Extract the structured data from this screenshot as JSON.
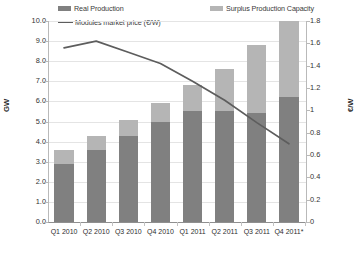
{
  "chart_data": {
    "type": "bar",
    "title": "",
    "subtitle": "",
    "categories": [
      "Q1 2010",
      "Q2 2010",
      "Q3 2010",
      "Q4 2010",
      "Q1 2011",
      "Q2 2011",
      "Q3 2011",
      "Q4 2011*"
    ],
    "stacked": true,
    "series": [
      {
        "name": "Real Production",
        "type": "bar",
        "axis": "left",
        "color": "#808080",
        "values": [
          2.9,
          3.6,
          4.3,
          5.0,
          5.5,
          5.5,
          5.4,
          6.2
        ]
      },
      {
        "name": "Surplus Production Capacity",
        "type": "bar",
        "axis": "left",
        "color": "#b5b5b5",
        "values": [
          0.7,
          0.7,
          0.8,
          0.9,
          1.3,
          2.1,
          3.4,
          3.8
        ]
      },
      {
        "name": "Modules market price (€/W)",
        "type": "line",
        "axis": "right",
        "color": "#5d5d5d",
        "values": [
          1.56,
          1.62,
          1.52,
          1.42,
          1.26,
          1.09,
          0.89,
          0.7
        ]
      }
    ],
    "totals": [
      3.6,
      4.3,
      5.1,
      5.9,
      6.8,
      7.6,
      8.8,
      10.0
    ],
    "left_axis": {
      "label": "GW",
      "min": 0.0,
      "max": 10.0,
      "step": 1.0,
      "ticks": [
        "0.0",
        "1.0",
        "2.0",
        "3.0",
        "4.0",
        "5.0",
        "6.0",
        "7.0",
        "8.0",
        "9.0",
        "10.0"
      ]
    },
    "right_axis": {
      "label": "€/W",
      "min": 0,
      "max": 1.8,
      "step": 0.2,
      "ticks": [
        "0",
        "0.2",
        "0.4",
        "0.6",
        "0.8",
        "1",
        "1.2",
        "1.4",
        "1.6",
        "1.8"
      ]
    },
    "xlabel": "",
    "grid": true,
    "legend_position": "top",
    "legend": [
      {
        "label": "Real Production",
        "marker": "bar",
        "color": "#808080"
      },
      {
        "label": "Modules market price (€/W)",
        "marker": "line",
        "color": "#5d5d5d"
      },
      {
        "label": "Surplus Production Capacity",
        "marker": "bar",
        "color": "#b5b5b5"
      }
    ]
  },
  "footnote": ""
}
